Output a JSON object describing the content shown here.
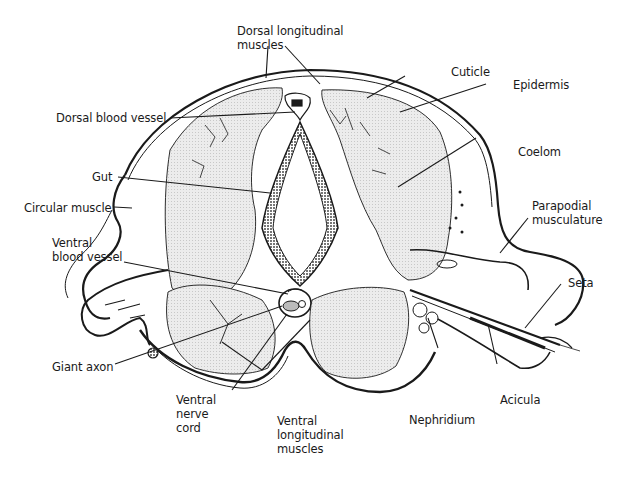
{
  "diagram": {
    "type": "anatomical cross-section",
    "colors": {
      "ink": "#1a1a1a",
      "fill": "#e6e6e6",
      "background": "#ffffff"
    }
  },
  "labels": {
    "dorsal_longitudinal_muscles": "Dorsal longitudinal\nmuscles",
    "dorsal_blood_vessel": "Dorsal blood vessel",
    "gut": "Gut",
    "circular_muscle": "Circular muscle",
    "ventral_blood_vessel": "Ventral\nblood vessel",
    "giant_axon": "Giant axon",
    "ventral_nerve_cord": "Ventral\nnerve\ncord",
    "ventral_longitudinal_muscles": "Ventral\nlongitudinal\nmuscles",
    "nephridium": "Nephridium",
    "acicula": "Acicula",
    "seta": "Seta",
    "parapodial_musculature": "Parapodial\nmusculature",
    "coelom": "Coelom",
    "epidermis": "Epidermis",
    "cuticle": "Cuticle"
  }
}
